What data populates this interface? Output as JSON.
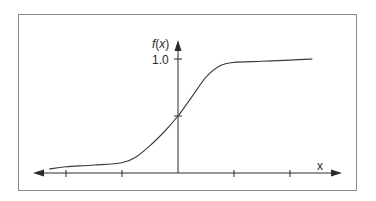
{
  "figure": {
    "type": "sigmoid-diagram",
    "y_axis_label": "f(x)",
    "y_axis_label_func": "f",
    "y_axis_label_var": "x",
    "x_axis_label": "x",
    "y_tick_label": "1.0",
    "colors": {
      "frame": "#8a8a8a",
      "axis": "#2a2a2a",
      "curve": "#3a3a3a"
    }
  },
  "chart_data": {
    "type": "line",
    "title": "",
    "xlabel": "x",
    "ylabel": "f(x)",
    "x_ticks": [
      -2,
      -1,
      0,
      1,
      2
    ],
    "x_tick_labels": [],
    "y_ticks": [
      0.5,
      1.0
    ],
    "y_tick_labels": [
      "",
      "1.0"
    ],
    "xlim": [
      -2.6,
      2.9
    ],
    "ylim": [
      0,
      1.2
    ],
    "grid": false,
    "legend": "none",
    "series": [
      {
        "name": "f(x)",
        "x": [
          -2.3,
          -2.0,
          -1.5,
          -1.0,
          -0.75,
          -0.5,
          -0.25,
          0.0,
          0.25,
          0.5,
          0.75,
          1.0,
          1.5,
          2.0,
          2.4
        ],
        "y": [
          0.035,
          0.055,
          0.07,
          0.09,
          0.14,
          0.24,
          0.36,
          0.5,
          0.67,
          0.84,
          0.94,
          0.97,
          0.98,
          0.99,
          1.0
        ]
      }
    ]
  }
}
